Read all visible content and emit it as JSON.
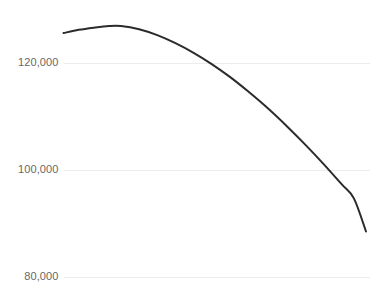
{
  "chart_data": {
    "type": "line",
    "title": "",
    "subtitle": "",
    "xlabel": "",
    "ylabel": "",
    "grid": true,
    "grid_axis": "y",
    "legend": false,
    "legend_position": "none",
    "background_color": "#ffffff",
    "line_color": "#2b2b2b",
    "line_width": 2,
    "grid_color": "#ececec",
    "tick_label_color": "#676767",
    "ylim": [
      78000,
      128500
    ],
    "yticks": [
      80000,
      100000,
      120000
    ],
    "ytick_labels": [
      "80,000",
      "100,000",
      "120,000"
    ],
    "xticks": [],
    "xtick_labels": [],
    "xlim": [
      0,
      100
    ],
    "series": [
      {
        "name": "series-1",
        "color": "#2b2b2b",
        "x": [
          0,
          5,
          10,
          15,
          19,
          25,
          31,
          37,
          43,
          49,
          55,
          61,
          68,
          74,
          80,
          86,
          92,
          96,
          100
        ],
        "values": [
          125600,
          126200,
          126600,
          126900,
          126900,
          126300,
          125200,
          123700,
          121900,
          119800,
          117400,
          114700,
          111300,
          108100,
          104700,
          101100,
          97300,
          94700,
          88500
        ]
      }
    ]
  },
  "axis": {
    "y_labels": [
      {
        "text": "120,000",
        "value": 120000
      },
      {
        "text": "100,000",
        "value": 100000
      },
      {
        "text": "80,000",
        "value": 80000
      }
    ]
  }
}
